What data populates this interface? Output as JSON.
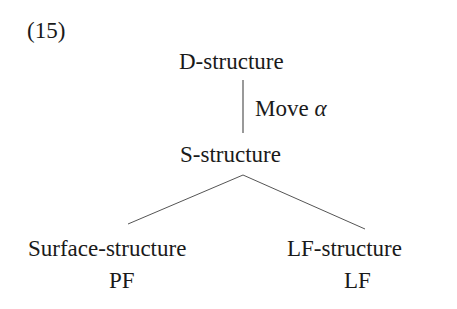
{
  "example": {
    "number": "(15)"
  },
  "tree": {
    "root": "D-structure",
    "transformation": {
      "label": "Move",
      "symbol": "α"
    },
    "intermediate": "S-structure",
    "left_branch": {
      "label": "Surface-structure",
      "sublabel": "PF"
    },
    "right_branch": {
      "label": "LF-structure",
      "sublabel": "LF"
    }
  },
  "colors": {
    "text": "#1a1a1a",
    "lines": "#555555",
    "background": "#ffffff"
  }
}
